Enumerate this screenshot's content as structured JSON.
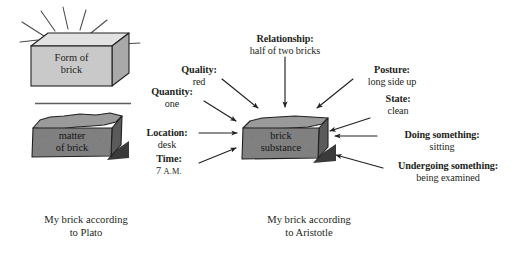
{
  "figure": {
    "colors": {
      "form_brick_fill": "#c9c9c9",
      "form_brick_top": "#e2e2e2",
      "form_brick_side": "#aaaaaa",
      "matter_brick_fill": "#808080",
      "matter_brick_top": "#9a9a9a",
      "matter_brick_side": "#585858",
      "substance_brick_fill": "#808080",
      "substance_brick_top": "#9a9a9a",
      "substance_brick_side": "#585858",
      "stroke": "#231f20",
      "background": "#ffffff"
    }
  },
  "plato": {
    "form_brick": {
      "line1": "Form of",
      "line2": "brick"
    },
    "matter_brick": {
      "line1": "matter",
      "line2": "of brick"
    },
    "caption": {
      "line1": "My brick according",
      "line2": "to Plato"
    },
    "rays_count": 7
  },
  "aristotle": {
    "center_brick": {
      "line1": "brick",
      "line2": "substance"
    },
    "caption": {
      "line1": "My brick according",
      "line2": "to Aristotle"
    },
    "categories": [
      {
        "id": "relationship",
        "header": "Relationship:",
        "value": "half of two bricks"
      },
      {
        "id": "quality",
        "header": "Quality:",
        "value": "red"
      },
      {
        "id": "quantity",
        "header": "Quantity:",
        "value": "one"
      },
      {
        "id": "location",
        "header": "Location:",
        "value": "desk"
      },
      {
        "id": "time",
        "header": "Time:",
        "value": "7",
        "value_suffix": "A.M."
      },
      {
        "id": "posture",
        "header": "Posture:",
        "value": "long side up"
      },
      {
        "id": "state",
        "header": "State:",
        "value": "clean"
      },
      {
        "id": "doing",
        "header": "Doing something:",
        "value": "sitting"
      },
      {
        "id": "undergoing",
        "header": "Undergoing something:",
        "value": "being examined"
      }
    ]
  }
}
